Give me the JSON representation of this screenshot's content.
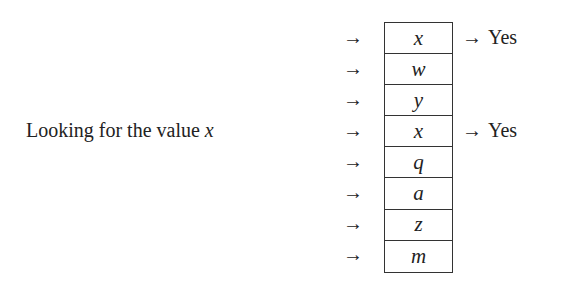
{
  "caption": {
    "text": "Looking for the value ",
    "variable": "x"
  },
  "array": {
    "cells": [
      "x",
      "w",
      "y",
      "x",
      "q",
      "a",
      "z",
      "m"
    ],
    "matches": [
      0,
      3
    ]
  },
  "arrow_glyph": "→",
  "match_label": "Yes"
}
